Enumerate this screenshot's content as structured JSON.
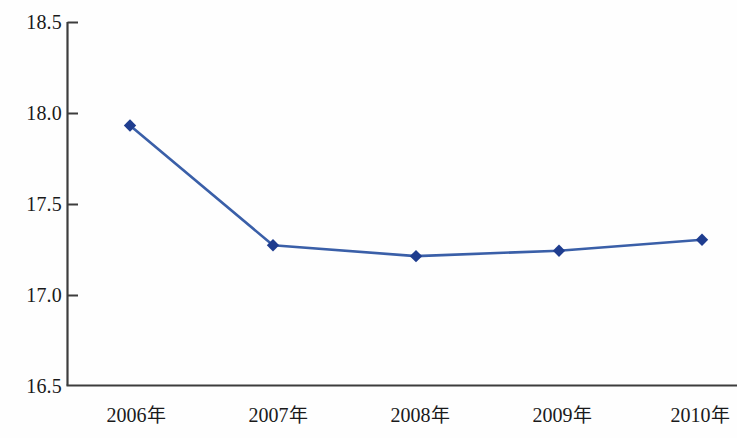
{
  "chart_data": {
    "type": "line",
    "title": "",
    "subtitle": "",
    "xlabel": "",
    "ylabel": "",
    "categories": [
      "2006年",
      "2007年",
      "2008年",
      "2009年",
      "2010年"
    ],
    "values": [
      17.93,
      17.27,
      17.21,
      17.24,
      17.3
    ],
    "series": [
      {
        "name": "",
        "values": [
          17.93,
          17.27,
          17.21,
          17.24,
          17.3
        ]
      }
    ],
    "ylim": [
      16.5,
      18.5
    ],
    "ytick_labels": [
      "18.5",
      "18.0",
      "17.5",
      "17.0",
      "16.5"
    ],
    "ytick_values": [
      18.5,
      18.0,
      17.5,
      17.0,
      16.5
    ],
    "xtick_labels": [
      "2006年",
      "2007年",
      "2008年",
      "2009年",
      "2010年"
    ],
    "grid": false,
    "legend": false,
    "legend_position": "none",
    "marker": "diamond",
    "line_color": "#3a5fa8",
    "marker_color": "#1f3d8f",
    "axis_color": "#3d3d3d",
    "background_color": "#fefefe",
    "text_color": "#1a1a1a",
    "annotations": []
  },
  "axis": {
    "y_ticks": [
      {
        "label": "18.5",
        "value": 18.5
      },
      {
        "label": "18.0",
        "value": 18.0
      },
      {
        "label": "17.5",
        "value": 17.5
      },
      {
        "label": "17.0",
        "value": 17.0
      },
      {
        "label": "16.5",
        "value": 16.5
      }
    ],
    "x_ticks": [
      {
        "label": "2006",
        "suffix": "年"
      },
      {
        "label": "2007",
        "suffix": "年"
      },
      {
        "label": "2008",
        "suffix": "年"
      },
      {
        "label": "2009",
        "suffix": "年"
      },
      {
        "label": "2010",
        "suffix": "年"
      }
    ]
  }
}
